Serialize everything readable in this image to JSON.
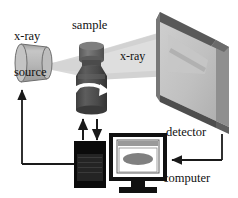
{
  "figure": {
    "type": "schematic-diagram",
    "width": 238,
    "height": 198,
    "background_color": "#ffffff"
  },
  "labels": {
    "xray_source_line1": "x-ray",
    "xray_source_line2": "source",
    "sample": "sample",
    "xray_beam": "x-ray",
    "detector": "detector",
    "computer": "computer"
  },
  "components": {
    "source": {
      "name": "x-ray source",
      "shape": "cylinder",
      "body_color": "#b4b4b4",
      "face_color": "#c8c8c8",
      "edge_color": "#6e6e6e"
    },
    "sample": {
      "name": "sample vial",
      "shape": "bottle",
      "body_color": "#545454",
      "cap_color": "#6d6d6d",
      "rotation_arrow": "white-curved-arrow",
      "rotation_arrow_color": "#ffffff"
    },
    "beam": {
      "name": "x-ray beam",
      "shape": "diverging-cone",
      "color": "#d8d8d8",
      "color_secondary": "#cfcfcf"
    },
    "detector": {
      "name": "detector panel",
      "shape": "3d-slab",
      "face_color": "#c3c3c3",
      "bevel_color": "#565656",
      "side_color": "#8a8a8a",
      "streak_color": "#6f6f6f"
    },
    "controller": {
      "name": "control unit",
      "shape": "black-box",
      "color": "#0b0b0b",
      "inner_panel_color": "#232323"
    },
    "computer": {
      "name": "computer monitor",
      "shape": "crt-monitor",
      "frame_color": "#111111",
      "screen_color": "#ffffff",
      "window_titlebar_color": "#9a9a9a",
      "plot_ellipse_color": "#808080",
      "stand_color": "#111111"
    }
  },
  "connectors": {
    "source_feedback_arrow": {
      "name": "controller to source arrow",
      "direction": "up",
      "color": "#1a1a1a"
    },
    "sample_up_arrow": {
      "name": "controller to sample arrow",
      "direction": "up",
      "color": "#1a1a1a"
    },
    "sample_down_arrow": {
      "name": "sample to controller arrow",
      "direction": "down",
      "color": "#1a1a1a"
    },
    "detector_to_computer_arrow": {
      "name": "detector to computer arrow",
      "direction": "left",
      "color": "#1a1a1a"
    }
  }
}
